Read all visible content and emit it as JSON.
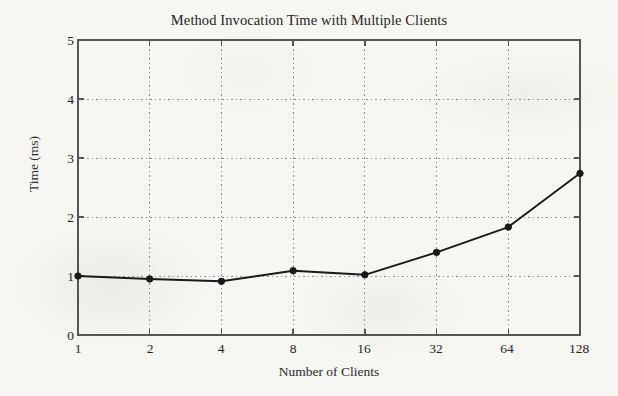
{
  "chart_data": {
    "type": "line",
    "title": "Method Invocation Time with Multiple Clients",
    "xlabel": "Number of Clients",
    "ylabel": "Time (ms)",
    "categories": [
      "1",
      "2",
      "4",
      "8",
      "16",
      "32",
      "64",
      "128"
    ],
    "x": [
      1,
      2,
      4,
      8,
      16,
      32,
      64,
      128
    ],
    "values": [
      1.0,
      0.95,
      0.91,
      1.09,
      1.02,
      1.4,
      1.83,
      2.74
    ],
    "series": [
      {
        "name": "Method invocation time",
        "values": [
          1.0,
          0.95,
          0.91,
          1.09,
          1.02,
          1.4,
          1.83,
          2.74
        ]
      }
    ],
    "xlim": [
      1,
      128
    ],
    "ylim": [
      0,
      5
    ],
    "x_scale": "log2",
    "x_tick_labels": [
      "1",
      "2",
      "4",
      "8",
      "16",
      "32",
      "64",
      "128"
    ],
    "y_tick_labels": [
      "0",
      "1",
      "2",
      "3",
      "4",
      "5"
    ],
    "y_ticks": [
      0,
      1,
      2,
      3,
      4,
      5
    ],
    "grid": true,
    "grid_style": "dotted",
    "legend": "none",
    "marker": "filled-circle",
    "line_color": "#1a1a1a",
    "marker_color": "#1a1a1a",
    "grid_color": "#8d8d8d",
    "axis_color": "#555555",
    "background_color": "#f7f6f2"
  }
}
